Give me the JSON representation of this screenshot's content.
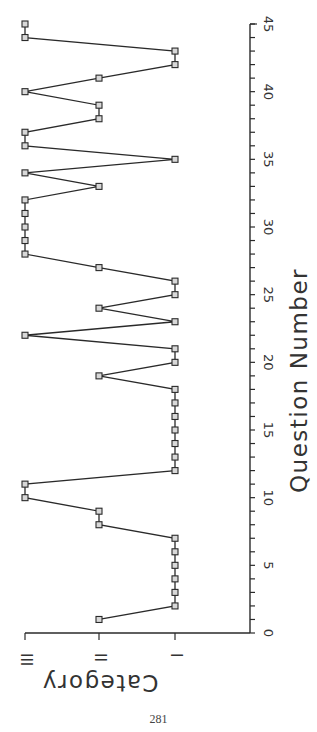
{
  "chart_data": {
    "type": "line",
    "orientation": "rotated-90-clockwise",
    "title": "",
    "xlabel": "Question Number",
    "ylabel": "Category",
    "xlim": [
      0,
      45
    ],
    "x_ticks": [
      0,
      5,
      10,
      15,
      20,
      25,
      30,
      35,
      40,
      45
    ],
    "x_minor_tick_step": 1,
    "y_categories": [
      "I",
      "II",
      "III"
    ],
    "grid": false,
    "legend": null,
    "marker": "square",
    "series": [
      {
        "name": "Category",
        "x": [
          1,
          2,
          3,
          4,
          5,
          6,
          7,
          8,
          9,
          10,
          11,
          12,
          13,
          14,
          15,
          16,
          17,
          18,
          19,
          20,
          21,
          22,
          23,
          24,
          25,
          26,
          27,
          28,
          29,
          30,
          31,
          32,
          33,
          34,
          35,
          36,
          37,
          38,
          39,
          40,
          41,
          42,
          43,
          44,
          45
        ],
        "values": [
          "II",
          "I",
          "I",
          "I",
          "I",
          "I",
          "I",
          "II",
          "II",
          "III",
          "III",
          "I",
          "I",
          "I",
          "I",
          "I",
          "I",
          "I",
          "II",
          "I",
          "I",
          "III",
          "I",
          "II",
          "I",
          "I",
          "II",
          "III",
          "III",
          "III",
          "III",
          "III",
          "II",
          "III",
          "I",
          "III",
          "III",
          "II",
          "II",
          "III",
          "II",
          "I",
          "I",
          "III",
          "III"
        ]
      }
    ]
  },
  "axes": {
    "x_title": "Question Number",
    "y_title": "Category",
    "x_tick_labels": [
      "0",
      "5",
      "10",
      "15",
      "20",
      "25",
      "30",
      "35",
      "40",
      "45"
    ],
    "y_tick_labels": [
      "I",
      "II",
      "III"
    ]
  },
  "page": {
    "number": "281"
  },
  "colors": {
    "ink": "#2a2a2a",
    "marker_fill": "#d8d8d8",
    "background": "#ffffff"
  }
}
